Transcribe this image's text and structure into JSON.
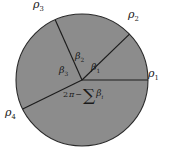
{
  "figure": {
    "background_color": "#ffffff",
    "disk_fill_color": "#8c8c8c",
    "stroke_color": "#1c1c1c",
    "circle": {
      "cx": 82,
      "cy": 80,
      "r": 66
    },
    "radii": [
      {
        "id": "rho1",
        "label_text": "ρ",
        "subscript": "1",
        "angle_deg": 0,
        "label_x": 152,
        "label_y": 73
      },
      {
        "id": "rho2",
        "label_text": "ρ",
        "subscript": "2",
        "angle_deg": 44,
        "label_x": 131,
        "label_y": 14
      },
      {
        "id": "rho3",
        "label_text": "ρ",
        "subscript": "3",
        "angle_deg": 114,
        "label_x": 34,
        "label_y": 1
      },
      {
        "id": "rho4",
        "label_text": "ρ",
        "subscript": "4",
        "angle_deg": 206,
        "label_x": 7,
        "label_y": 112
      }
    ],
    "angles": [
      {
        "id": "beta1",
        "label_text": "β",
        "subscript": "1",
        "label_x": 92,
        "label_y": 65
      },
      {
        "id": "beta2",
        "label_text": "β",
        "subscript": "2",
        "label_x": 76,
        "label_y": 54
      },
      {
        "id": "beta3",
        "label_text": "β",
        "subscript": "3",
        "label_x": 60,
        "label_y": 68
      }
    ],
    "reflex_angle": {
      "id": "reflex-angle-expression",
      "two": "2",
      "pi": "π",
      "minus": "−",
      "sigma": "∑",
      "beta": "β",
      "index": "i",
      "label_x": 64,
      "label_y": 91
    }
  }
}
